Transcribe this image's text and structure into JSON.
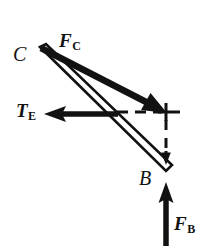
{
  "figure": {
    "kind": "free-body-diagram",
    "width": 206,
    "height": 248,
    "background_color": "#ffffff",
    "ink_color": "#121212"
  },
  "labels": {
    "joint_c": {
      "text": "C",
      "role": "joint-label"
    },
    "joint_b": {
      "text": "B",
      "role": "joint-label"
    },
    "force_c": {
      "symbol": "F",
      "subscript": "C",
      "role": "force-vector-label"
    },
    "tension_e": {
      "symbol": "T",
      "subscript": "E",
      "role": "force-vector-label"
    },
    "force_b": {
      "symbol": "F",
      "subscript": "B",
      "role": "force-vector-label"
    }
  },
  "vectors": [
    {
      "name": "F_C",
      "label": "F",
      "subscript": "C",
      "style": "solid-thick",
      "from": [
        40,
        47
      ],
      "to": [
        166,
        112
      ],
      "direction": "down-right",
      "arrowhead": "end"
    },
    {
      "name": "T_E",
      "label": "T",
      "subscript": "E",
      "style": "solid-thick",
      "from": [
        118,
        114
      ],
      "to": [
        44,
        114
      ],
      "direction": "left",
      "arrowhead": "end"
    },
    {
      "name": "F_B",
      "label": "F",
      "subscript": "B",
      "style": "solid-thick",
      "from": [
        166,
        245
      ],
      "to": [
        166,
        183
      ],
      "direction": "up",
      "arrowhead": "end"
    }
  ],
  "members": [
    {
      "name": "member-CB",
      "style": "outlined-two-line",
      "from": [
        40,
        47
      ],
      "to": [
        166,
        167
      ],
      "description": "two-force member drawn as a narrow open bar from C to B"
    }
  ],
  "construction_lines": [
    {
      "name": "horizontal-dashed-guide",
      "style": "dashed",
      "from": [
        118,
        112
      ],
      "to": [
        166,
        112
      ],
      "arrowhead": "none"
    },
    {
      "name": "vertical-dashed-component",
      "style": "dashed",
      "from": [
        166,
        118
      ],
      "to": [
        166,
        162
      ],
      "arrowhead": "end",
      "direction": "down"
    }
  ],
  "markers": [
    {
      "name": "cross-tick-mark",
      "shape": "plus",
      "at": [
        166,
        112
      ],
      "size": 17
    }
  ]
}
